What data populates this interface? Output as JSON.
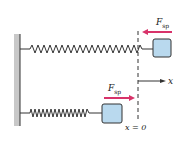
{
  "diagram": {
    "top": {
      "force_label": "F",
      "force_sub": "sp",
      "force_direction": "left"
    },
    "bottom": {
      "force_label": "F",
      "force_sub": "sp",
      "force_direction": "right"
    },
    "axis_label": "x",
    "origin_label": "x = 0",
    "colors": {
      "wall": "#c8c8c8",
      "spring": "#333333",
      "block_fill": "#b9d9ee",
      "block_stroke": "#333333",
      "force_arrow": "#d8336a",
      "dashed_line": "#333333"
    }
  }
}
